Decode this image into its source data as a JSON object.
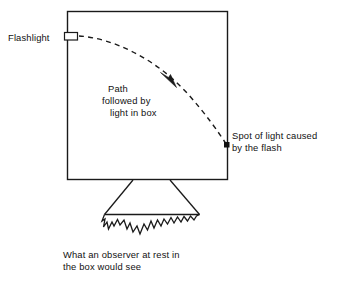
{
  "figure": {
    "background_color": "#ffffff",
    "ink_color": "#1a1a1a",
    "labels": {
      "flashlight": "Flashlight",
      "path_line_1": "Path",
      "path_line_2": "followed by",
      "path_line_3": "light in box",
      "spot_line_1": "Spot of light caused",
      "spot_line_2": "by the flash",
      "caption_line_1": "What an observer at rest in",
      "caption_line_2": "the box would see"
    },
    "elements": {
      "box_name": "box-outline",
      "flashlight_name": "flashlight-emitter",
      "path_name": "dashed-light-path",
      "arrow_name": "path-direction-arrow",
      "spot_name": "light-spot-marker",
      "funnel_name": "observer-view-funnel",
      "jagged_name": "jagged-beam-edge"
    }
  }
}
